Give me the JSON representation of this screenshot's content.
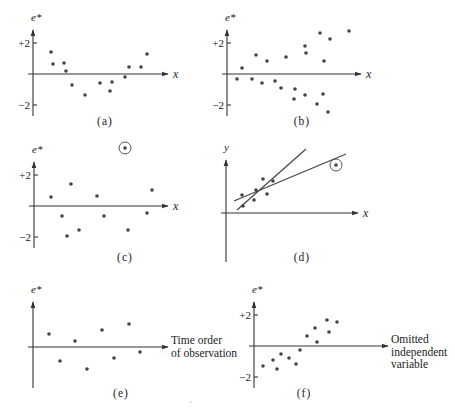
{
  "figure": {
    "panels": [
      {
        "id": "a",
        "caption": "(a)",
        "ylabel": "e*",
        "xlabel": "x",
        "ticks": [
          {
            "label": "+2",
            "value": 2
          },
          {
            "label": "−2",
            "value": -2
          }
        ],
        "axis": {
          "x0": 33,
          "y0": 74,
          "xend": 168,
          "ytop": 30,
          "ybot": 116,
          "ypx_per_unit": 15.5
        },
        "caption_pos": [
          105,
          125
        ],
        "points": [
          [
            51,
            52
          ],
          [
            53,
            64
          ],
          [
            64,
            63
          ],
          [
            66,
            71
          ],
          [
            72,
            85
          ],
          [
            85,
            95
          ],
          [
            100,
            83
          ],
          [
            110,
            91
          ],
          [
            112,
            82
          ],
          [
            125,
            77
          ],
          [
            129,
            67
          ],
          [
            141,
            67
          ],
          [
            147,
            54
          ]
        ]
      },
      {
        "id": "b",
        "caption": "(b)",
        "ylabel": "e*",
        "xlabel": "x",
        "ticks": [
          {
            "label": "+2",
            "value": 2
          },
          {
            "label": "−2",
            "value": -2
          }
        ],
        "axis": {
          "x0": 227,
          "y0": 74,
          "xend": 361,
          "ytop": 30,
          "ybot": 116,
          "ypx_per_unit": 15.5
        },
        "caption_pos": [
          302,
          125
        ],
        "points": [
          [
            237,
            79
          ],
          [
            242,
            68
          ],
          [
            252,
            79
          ],
          [
            256,
            55
          ],
          [
            262,
            83
          ],
          [
            267,
            61
          ],
          [
            275,
            81
          ],
          [
            281,
            88
          ],
          [
            286,
            57
          ],
          [
            294,
            99
          ],
          [
            295,
            89
          ],
          [
            305,
            46
          ],
          [
            306,
            53
          ],
          [
            305,
            95
          ],
          [
            317,
            104
          ],
          [
            320,
            33
          ],
          [
            323,
            94
          ],
          [
            324,
            61
          ],
          [
            328,
            112
          ],
          [
            330,
            39
          ],
          [
            349,
            31
          ]
        ]
      },
      {
        "id": "c",
        "caption": "(c)",
        "ylabel": "e*",
        "xlabel": "x",
        "ticks": [
          {
            "label": "+2",
            "value": 2
          },
          {
            "label": "−2",
            "value": -2
          }
        ],
        "axis": {
          "x0": 34,
          "y0": 206,
          "xend": 168,
          "ytop": 162,
          "ybot": 248,
          "ypx_per_unit": 15.5
        },
        "caption_pos": [
          125,
          261
        ],
        "points": [
          [
            51,
            197
          ],
          [
            62,
            216
          ],
          [
            71,
            184
          ],
          [
            67,
            236
          ],
          [
            79,
            230
          ],
          [
            97,
            196
          ],
          [
            104,
            216
          ],
          [
            128,
            230
          ],
          [
            147,
            213
          ],
          [
            152,
            190
          ]
        ],
        "outliers": [
          [
            125,
            148
          ]
        ]
      },
      {
        "id": "d",
        "caption": "(d)",
        "ylabel": "y",
        "xlabel": "x",
        "ticks": [],
        "axis": {
          "x0": 226,
          "y0": 213,
          "xend": 358,
          "ytop": 160,
          "ybot": 262
        },
        "caption_pos": [
          302,
          261
        ],
        "points": [
          [
            243,
            206
          ],
          [
            242,
            195
          ],
          [
            254,
            200
          ],
          [
            256,
            190
          ],
          [
            263,
            179
          ],
          [
            267,
            194
          ],
          [
            273,
            181
          ]
        ],
        "outliers": [
          [
            336,
            165
          ]
        ],
        "lines": [
          {
            "name": "fit-without-outlier",
            "x1": 237,
            "y1": 210,
            "x2": 306,
            "y2": 149
          },
          {
            "name": "fit-with-outlier",
            "x1": 234,
            "y1": 201,
            "x2": 346,
            "y2": 154
          }
        ]
      },
      {
        "id": "e",
        "caption": "(e)",
        "ylabel": "e*",
        "xlabel_lines": [
          "Time order",
          "of observation"
        ],
        "ticks": [],
        "axis": {
          "x0": 33,
          "y0": 347,
          "xend": 168,
          "ytop": 302,
          "ybot": 388
        },
        "caption_pos": [
          121,
          397
        ],
        "points": [
          [
            49,
            334
          ],
          [
            60,
            361
          ],
          [
            75,
            341
          ],
          [
            87,
            369
          ],
          [
            102,
            330
          ],
          [
            114,
            358
          ],
          [
            129,
            324
          ],
          [
            140,
            352
          ]
        ]
      },
      {
        "id": "f",
        "caption": "(f)",
        "ylabel": "e*",
        "xlabel_lines": [
          "Omitted",
          "independent",
          "variable"
        ],
        "ticks": [
          {
            "label": "+2",
            "value": 2
          },
          {
            "label": "−2",
            "value": -2
          }
        ],
        "axis": {
          "x0": 254,
          "y0": 346,
          "xend": 388,
          "ytop": 302,
          "ybot": 388,
          "ypx_per_unit": 15.5
        },
        "caption_pos": [
          304,
          397
        ],
        "points": [
          [
            263,
            366
          ],
          [
            273,
            360
          ],
          [
            277,
            369
          ],
          [
            281,
            354
          ],
          [
            289,
            358
          ],
          [
            296,
            364
          ],
          [
            300,
            350
          ],
          [
            307,
            336
          ],
          [
            315,
            328
          ],
          [
            317,
            342
          ],
          [
            327,
            320
          ],
          [
            329,
            332
          ],
          [
            337,
            322
          ]
        ]
      }
    ],
    "stray_mark": [
      191,
      402
    ]
  }
}
